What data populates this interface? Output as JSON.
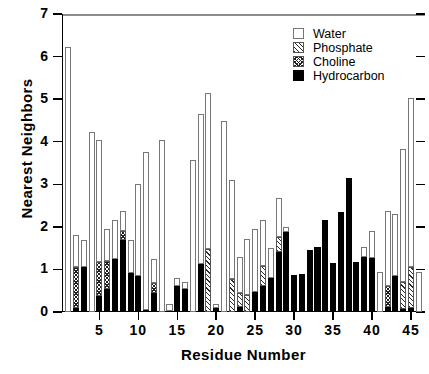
{
  "chart_data": {
    "type": "bar",
    "stacked": true,
    "title": "",
    "xlabel": "Residue  Number",
    "ylabel": "Nearest  Neighbors",
    "xlim": [
      0.2,
      46.8
    ],
    "ylim": [
      0,
      7
    ],
    "yticks": [
      0,
      1,
      2,
      3,
      4,
      5,
      6,
      7
    ],
    "xticks": [
      5,
      10,
      15,
      20,
      25,
      30,
      35,
      40,
      45
    ],
    "grid": false,
    "legend_position": "top-right",
    "series": [
      {
        "name": "Water",
        "key": "water",
        "fill": "open",
        "color": "#ffffff"
      },
      {
        "name": "Phosphate",
        "key": "phosphate",
        "fill": "diagonal",
        "color": "#2b2b2b"
      },
      {
        "name": "Choline",
        "key": "choline",
        "fill": "cross-hatch",
        "color": "#1f1f1f"
      },
      {
        "name": "Hydrocarbon",
        "key": "hydrocarbon",
        "fill": "solid",
        "color": "#000000"
      }
    ],
    "categories": [
      1,
      2,
      3,
      4,
      5,
      6,
      7,
      8,
      9,
      10,
      11,
      12,
      13,
      14,
      15,
      16,
      17,
      18,
      19,
      20,
      21,
      22,
      23,
      24,
      25,
      26,
      27,
      28,
      29,
      30,
      31,
      32,
      33,
      34,
      35,
      36,
      37,
      38,
      39,
      40,
      41,
      42,
      43,
      44,
      45,
      46
    ],
    "bars": [
      {
        "x": 1,
        "hydrocarbon": 0.0,
        "choline": 0.0,
        "phosphate": 0.0,
        "water": 6.22,
        "total": 6.22
      },
      {
        "x": 2,
        "hydrocarbon": 0.1,
        "choline": 0.95,
        "phosphate": 0.0,
        "water": 0.75,
        "total": 1.8
      },
      {
        "x": 3,
        "hydrocarbon": 1.05,
        "choline": 0.0,
        "phosphate": 0.0,
        "water": 0.65,
        "total": 1.7
      },
      {
        "x": 4,
        "hydrocarbon": 0.0,
        "choline": 0.0,
        "phosphate": 0.0,
        "water": 4.22,
        "total": 4.22
      },
      {
        "x": 5,
        "hydrocarbon": 0.38,
        "choline": 0.8,
        "phosphate": 0.0,
        "water": 2.87,
        "total": 4.05
      },
      {
        "x": 6,
        "hydrocarbon": 0.55,
        "choline": 0.65,
        "phosphate": 0.0,
        "water": 0.75,
        "total": 1.95
      },
      {
        "x": 7,
        "hydrocarbon": 1.25,
        "choline": 0.0,
        "phosphate": 0.0,
        "water": 0.92,
        "total": 2.17
      },
      {
        "x": 8,
        "hydrocarbon": 1.68,
        "choline": 0.22,
        "phosphate": 0.0,
        "water": 0.47,
        "total": 2.37
      },
      {
        "x": 9,
        "hydrocarbon": 0.92,
        "choline": 0.0,
        "phosphate": 0.0,
        "water": 0.78,
        "total": 1.7
      },
      {
        "x": 10,
        "hydrocarbon": 0.85,
        "choline": 0.0,
        "phosphate": 0.0,
        "water": 2.15,
        "total": 3.0
      },
      {
        "x": 11,
        "hydrocarbon": 0.05,
        "choline": 0.0,
        "phosphate": 0.0,
        "water": 3.7,
        "total": 3.75
      },
      {
        "x": 12,
        "hydrocarbon": 0.45,
        "choline": 0.22,
        "phosphate": 0.0,
        "water": 0.58,
        "total": 1.25
      },
      {
        "x": 13,
        "hydrocarbon": 0.0,
        "choline": 0.0,
        "phosphate": 0.0,
        "water": 4.05,
        "total": 4.05
      },
      {
        "x": 14,
        "hydrocarbon": 0.02,
        "choline": 0.0,
        "phosphate": 0.0,
        "water": 0.18,
        "total": 0.2
      },
      {
        "x": 15,
        "hydrocarbon": 0.62,
        "choline": 0.0,
        "phosphate": 0.0,
        "water": 0.18,
        "total": 0.8
      },
      {
        "x": 16,
        "hydrocarbon": 0.55,
        "choline": 0.0,
        "phosphate": 0.0,
        "water": 0.15,
        "total": 0.7
      },
      {
        "x": 17,
        "hydrocarbon": 0.0,
        "choline": 0.0,
        "phosphate": 0.0,
        "water": 3.58,
        "total": 3.58
      },
      {
        "x": 18,
        "hydrocarbon": 1.12,
        "choline": 0.0,
        "phosphate": 0.0,
        "water": 3.53,
        "total": 4.65
      },
      {
        "x": 19,
        "hydrocarbon": 0.0,
        "choline": 0.0,
        "phosphate": 1.47,
        "water": 3.67,
        "total": 5.14
      },
      {
        "x": 20,
        "hydrocarbon": 0.1,
        "choline": 0.0,
        "phosphate": 0.0,
        "water": 0.1,
        "total": 0.2
      },
      {
        "x": 21,
        "hydrocarbon": 0.0,
        "choline": 0.0,
        "phosphate": 0.0,
        "water": 4.48,
        "total": 4.48
      },
      {
        "x": 22,
        "hydrocarbon": 0.0,
        "choline": 0.0,
        "phosphate": 0.78,
        "water": 2.32,
        "total": 3.1
      },
      {
        "x": 23,
        "hydrocarbon": 0.12,
        "choline": 0.0,
        "phosphate": 0.32,
        "water": 0.86,
        "total": 1.3
      },
      {
        "x": 24,
        "hydrocarbon": 0.0,
        "choline": 0.0,
        "phosphate": 0.4,
        "water": 1.32,
        "total": 1.72
      },
      {
        "x": 25,
        "hydrocarbon": 0.48,
        "choline": 0.0,
        "phosphate": 0.0,
        "water": 1.47,
        "total": 1.95
      },
      {
        "x": 26,
        "hydrocarbon": 0.62,
        "choline": 0.0,
        "phosphate": 0.45,
        "water": 1.08,
        "total": 2.15
      },
      {
        "x": 27,
        "hydrocarbon": 0.8,
        "choline": 0.0,
        "phosphate": 0.0,
        "water": 0.7,
        "total": 1.5
      },
      {
        "x": 28,
        "hydrocarbon": 1.42,
        "choline": 0.0,
        "phosphate": 0.35,
        "water": 0.9,
        "total": 2.67
      },
      {
        "x": 29,
        "hydrocarbon": 1.88,
        "choline": 0.0,
        "phosphate": 0.0,
        "water": 0.12,
        "total": 2.0
      },
      {
        "x": 30,
        "hydrocarbon": 0.88,
        "choline": 0.0,
        "phosphate": 0.0,
        "water": 0.0,
        "total": 0.88
      },
      {
        "x": 31,
        "hydrocarbon": 0.9,
        "choline": 0.0,
        "phosphate": 0.0,
        "water": 0.0,
        "total": 0.9
      },
      {
        "x": 32,
        "hydrocarbon": 1.45,
        "choline": 0.0,
        "phosphate": 0.0,
        "water": 0.0,
        "total": 1.45
      },
      {
        "x": 33,
        "hydrocarbon": 1.52,
        "choline": 0.0,
        "phosphate": 0.0,
        "water": 0.0,
        "total": 1.52
      },
      {
        "x": 34,
        "hydrocarbon": 2.15,
        "choline": 0.0,
        "phosphate": 0.0,
        "water": 0.0,
        "total": 2.15
      },
      {
        "x": 35,
        "hydrocarbon": 1.15,
        "choline": 0.0,
        "phosphate": 0.0,
        "water": 0.0,
        "total": 1.15
      },
      {
        "x": 36,
        "hydrocarbon": 2.35,
        "choline": 0.0,
        "phosphate": 0.0,
        "water": 0.0,
        "total": 2.35
      },
      {
        "x": 37,
        "hydrocarbon": 3.15,
        "choline": 0.0,
        "phosphate": 0.0,
        "water": 0.0,
        "total": 3.15
      },
      {
        "x": 38,
        "hydrocarbon": 1.18,
        "choline": 0.0,
        "phosphate": 0.0,
        "water": 0.0,
        "total": 1.18
      },
      {
        "x": 39,
        "hydrocarbon": 1.3,
        "choline": 0.0,
        "phosphate": 0.0,
        "water": 0.22,
        "total": 1.52
      },
      {
        "x": 40,
        "hydrocarbon": 1.28,
        "choline": 0.0,
        "phosphate": 0.0,
        "water": 0.62,
        "total": 1.9
      },
      {
        "x": 41,
        "hydrocarbon": 0.0,
        "choline": 0.0,
        "phosphate": 0.0,
        "water": 0.95,
        "total": 0.95
      },
      {
        "x": 42,
        "hydrocarbon": 0.12,
        "choline": 0.48,
        "phosphate": 0.0,
        "water": 1.78,
        "total": 2.38
      },
      {
        "x": 43,
        "hydrocarbon": 0.85,
        "choline": 0.0,
        "phosphate": 0.0,
        "water": 1.45,
        "total": 2.3
      },
      {
        "x": 44,
        "hydrocarbon": 0.08,
        "choline": 0.0,
        "phosphate": 0.62,
        "water": 3.12,
        "total": 3.82
      },
      {
        "x": 45,
        "hydrocarbon": 0.1,
        "choline": 0.0,
        "phosphate": 0.95,
        "water": 3.98,
        "total": 5.03
      },
      {
        "x": 46,
        "hydrocarbon": 0.0,
        "choline": 0.0,
        "phosphate": 0.0,
        "water": 0.95,
        "total": 0.95
      }
    ]
  },
  "legend": {
    "items": [
      {
        "label": "Water"
      },
      {
        "label": "Phosphate"
      },
      {
        "label": "Choline"
      },
      {
        "label": "Hydrocarbon"
      }
    ]
  },
  "axes": {
    "y_tick_labels": [
      "0",
      "1",
      "2",
      "3",
      "4",
      "5",
      "6",
      "7"
    ],
    "x_tick_labels": [
      "5",
      "10",
      "15",
      "20",
      "25",
      "30",
      "35",
      "40",
      "45"
    ],
    "y_title": "Nearest  Neighbors",
    "x_title": "Residue  Number"
  }
}
